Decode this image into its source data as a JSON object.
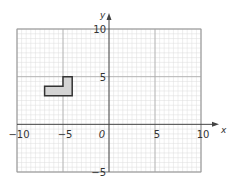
{
  "diagram": {
    "type": "coordinate-grid",
    "x_range": [
      -10,
      10
    ],
    "y_range": [
      -5,
      10
    ],
    "minor_step": 1,
    "major_step": 5,
    "axes": {
      "x_label": "x",
      "y_label": "y",
      "origin_label": "0"
    },
    "x_tick_labels": [
      {
        "value": -10,
        "label": "−10"
      },
      {
        "value": -5,
        "label": "−5"
      },
      {
        "value": 5,
        "label": "5"
      },
      {
        "value": 10,
        "label": "10"
      }
    ],
    "y_tick_labels": [
      {
        "value": 10,
        "label": "10"
      },
      {
        "value": 5,
        "label": "5"
      },
      {
        "value": -5,
        "label": "−5"
      }
    ],
    "shape": {
      "name": "L-shape",
      "vertices": [
        [
          -7,
          3
        ],
        [
          -7,
          4
        ],
        [
          -5,
          4
        ],
        [
          -5,
          5
        ],
        [
          -4,
          5
        ],
        [
          -4,
          3
        ]
      ],
      "fill": "#d4d4d4",
      "stroke": "#333333"
    },
    "colors": {
      "minor_grid": "#dddddd",
      "major_grid": "#a8a8a8",
      "axis": "#444444",
      "border": "#9a9a9a"
    }
  }
}
